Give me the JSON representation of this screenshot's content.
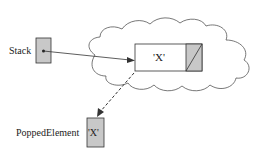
{
  "diagram": {
    "stack_label": "Stack",
    "node_value": "'X'",
    "popped_label": "PoppedElement",
    "popped_value": "'X'",
    "colors": {
      "box_fill": "#c8c8c8",
      "stroke": "#333333",
      "background": "#ffffff"
    }
  }
}
